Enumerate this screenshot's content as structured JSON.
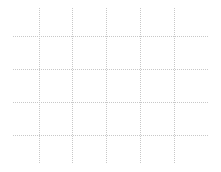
{
  "chart_data": {
    "type": "line",
    "title": "",
    "xlabel": "",
    "ylabel": "",
    "grid": true,
    "series": [],
    "categories": [],
    "legend": [],
    "gridlines": {
      "vertical_x": [
        39,
        72,
        106,
        140,
        174
      ],
      "vertical_y_range": [
        8,
        164
      ],
      "horizontal_y": [
        36,
        69,
        102,
        135
      ],
      "horizontal_x_range": [
        13,
        208
      ],
      "color": "#c8c8c8",
      "style": "dotted"
    }
  }
}
